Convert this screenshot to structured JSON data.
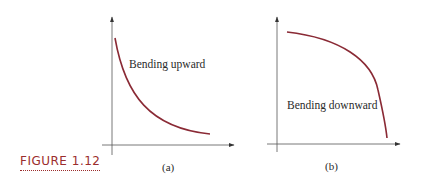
{
  "figure": {
    "label": "FIGURE 1.12",
    "accent_color": "#9b2d2d",
    "curve_color": "#8a2a35",
    "axis_color": "#555555"
  },
  "panels": [
    {
      "id": "a",
      "caption": "(a)",
      "annotation": "Bending upward",
      "curve_shape": "decreasing, concave up"
    },
    {
      "id": "b",
      "caption": "(b)",
      "annotation": "Bending downward",
      "curve_shape": "decreasing, concave down"
    }
  ]
}
